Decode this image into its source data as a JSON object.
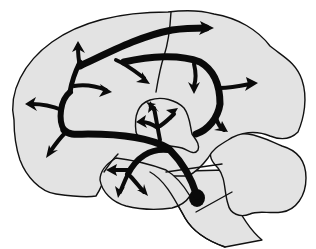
{
  "figure": {
    "background_color": "#ffffff",
    "tissue_color": "#e3e3e3",
    "line_color": "#111111",
    "arrow_color": "#0a0a0a"
  },
  "regions": [
    {
      "name": "cerebral-cortex"
    },
    {
      "name": "central-sulcus"
    },
    {
      "name": "thalamus"
    },
    {
      "name": "temporal-lobe"
    },
    {
      "name": "cerebellum"
    },
    {
      "name": "brainstem"
    }
  ],
  "pathway": {
    "origin": {
      "name": "brainstem-nucleus",
      "x": 197,
      "y": 198
    },
    "arrow_count": 19
  }
}
